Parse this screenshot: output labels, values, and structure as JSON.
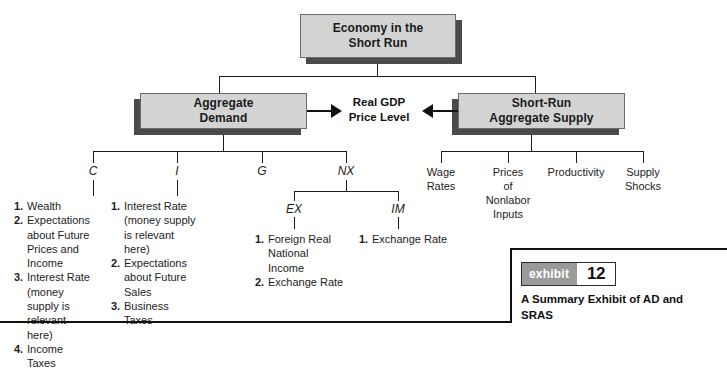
{
  "diagram": {
    "top_box": {
      "line1": "Economy in the",
      "line2": "Short Run"
    },
    "left_box": {
      "line1": "Aggregate",
      "line2": "Demand"
    },
    "right_box": {
      "line1": "Short-Run",
      "line2": "Aggregate Supply"
    },
    "center_label": {
      "line1": "Real GDP",
      "line2": "Price Level"
    },
    "ad_components": [
      {
        "symbol": "C"
      },
      {
        "symbol": "I"
      },
      {
        "symbol": "G"
      },
      {
        "symbol": "NX"
      }
    ],
    "nx_components": [
      {
        "symbol": "EX"
      },
      {
        "symbol": "IM"
      }
    ],
    "c_factors": [
      {
        "num": "1.",
        "text": "Wealth"
      },
      {
        "num": "2.",
        "text": "Expectations about Future Prices and Income"
      },
      {
        "num": "3.",
        "text": "Interest Rate (money supply is relevant here)"
      },
      {
        "num": "4.",
        "text": "Income Taxes"
      }
    ],
    "i_factors": [
      {
        "num": "1.",
        "text": "Interest Rate (money supply is relevant here)"
      },
      {
        "num": "2.",
        "text": "Expectations about Future Sales"
      },
      {
        "num": "3.",
        "text": "Business Taxes"
      }
    ],
    "ex_factors": [
      {
        "num": "1.",
        "text": "Foreign Real National Income"
      },
      {
        "num": "2.",
        "text": "Exchange Rate"
      }
    ],
    "im_factors": [
      {
        "num": "1.",
        "text": "Exchange Rate"
      }
    ],
    "sras_factors": [
      {
        "label": "Wage\nRates"
      },
      {
        "label": "Prices\nof\nNonlabor\nInputs"
      },
      {
        "label": "Productivity"
      },
      {
        "label": "Supply\nShocks"
      }
    ]
  },
  "exhibit": {
    "badge_word": "exhibit",
    "badge_number": "12",
    "caption": "A Summary Exhibit of AD and SRAS"
  },
  "colors": {
    "box_fill": "#d3d3d3",
    "box_shadow": "#4a4a4a",
    "line": "#1d1d1d",
    "badge_gray": "#9a9a9a"
  }
}
